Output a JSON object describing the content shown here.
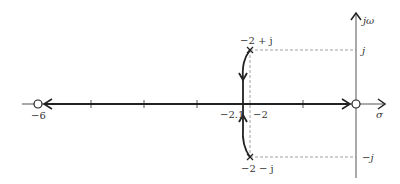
{
  "diagram": {
    "type": "root-locus",
    "axes": {
      "real_axis_label": "σ",
      "imag_axis_label": "jω",
      "imag_tick_upper": "j",
      "imag_tick_lower": "−j"
    },
    "poles": [
      {
        "label": "−2 + j",
        "re": -2,
        "im": 1
      },
      {
        "label": "−2 − j",
        "re": -2,
        "im": -1
      }
    ],
    "zeros": [
      {
        "label": "−6",
        "re": -6,
        "im": 0
      },
      {
        "label": "",
        "re": 0,
        "im": 0
      }
    ],
    "real_axis_labels": {
      "breakin": "−2.1",
      "pole_real": "−2"
    },
    "colors": {
      "locus": "#222222",
      "axis": "#555555",
      "dashed": "#888888"
    }
  }
}
